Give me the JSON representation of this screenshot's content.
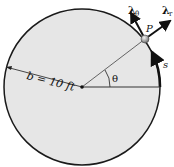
{
  "diagram": {
    "radius_label": "b = 10 ft",
    "angle_label": "θ",
    "point_label": "P",
    "arc_label": "s",
    "unit_vector_theta": {
      "symbol": "λ",
      "subscript": "θ"
    },
    "unit_vector_r": {
      "symbol": "λ",
      "subscript": "r"
    },
    "colors": {
      "disk_fill": "#e6e6e6",
      "outline": "#1a1a1a",
      "radius_line": "#555555",
      "particle": "#a0a0a0"
    }
  }
}
